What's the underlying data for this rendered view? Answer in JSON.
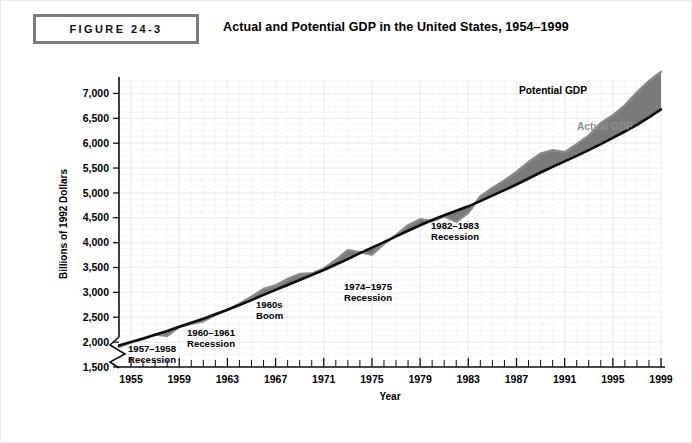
{
  "header": {
    "figure_number": "FIGURE 24-3",
    "title": "Actual and Potential GDP in the United States, 1954–1999"
  },
  "chart_data": {
    "type": "line",
    "title": "Actual and Potential GDP in the United States, 1954–1999",
    "xlabel": "Year",
    "ylabel": "Billions of 1992 Dollars",
    "xlim": [
      1954,
      1999
    ],
    "ylim": [
      1500,
      7250
    ],
    "yticks": [
      1500,
      2000,
      2500,
      3000,
      3500,
      4000,
      4500,
      5000,
      5500,
      6000,
      6500,
      7000
    ],
    "ytick_labels": [
      "1,500",
      "2,000",
      "2,500",
      "3,000",
      "3,500",
      "4,000",
      "4,500",
      "5,000",
      "5,500",
      "6,000",
      "6,500",
      "7,000"
    ],
    "xticks": [
      1955,
      1959,
      1963,
      1967,
      1971,
      1975,
      1979,
      1983,
      1987,
      1991,
      1995,
      1999
    ],
    "xtick_labels": [
      "1955",
      "1959",
      "1963",
      "1967",
      "1971",
      "1975",
      "1979",
      "1983",
      "1987",
      "1991",
      "1995",
      "1999"
    ],
    "minor_xtick_interval": 1,
    "grid": true,
    "axis_break_y": true,
    "legend_position": "inline-right",
    "x": [
      1954,
      1955,
      1956,
      1957,
      1958,
      1959,
      1960,
      1961,
      1962,
      1963,
      1964,
      1965,
      1966,
      1967,
      1968,
      1969,
      1970,
      1971,
      1972,
      1973,
      1974,
      1975,
      1976,
      1977,
      1978,
      1979,
      1980,
      1981,
      1982,
      1983,
      1984,
      1985,
      1986,
      1987,
      1988,
      1989,
      1990,
      1991,
      1992,
      1993,
      1994,
      1995,
      1996,
      1997,
      1998,
      1999
    ],
    "series": [
      {
        "name": "Potential GDP",
        "color": "#0d0d0d",
        "values": [
          1930,
          2005,
          2075,
          2150,
          2225,
          2310,
          2390,
          2470,
          2560,
          2650,
          2745,
          2845,
          2950,
          3050,
          3150,
          3250,
          3350,
          3450,
          3560,
          3670,
          3790,
          3900,
          4010,
          4125,
          4240,
          4350,
          4455,
          4550,
          4640,
          4730,
          4835,
          4945,
          5055,
          5170,
          5290,
          5410,
          5525,
          5635,
          5745,
          5860,
          5980,
          6105,
          6235,
          6370,
          6520,
          6680
        ]
      },
      {
        "name": "Actual GDP",
        "color": "#8a8a8a",
        "values": [
          1905,
          1990,
          2060,
          2150,
          2125,
          2305,
          2370,
          2420,
          2545,
          2650,
          2770,
          2910,
          3070,
          3140,
          3270,
          3370,
          3380,
          3480,
          3650,
          3850,
          3810,
          3760,
          3975,
          4150,
          4350,
          4470,
          4430,
          4530,
          4420,
          4600,
          4930,
          5100,
          5250,
          5420,
          5620,
          5790,
          5860,
          5820,
          5980,
          6150,
          6400,
          6560,
          6760,
          7020,
          7250,
          7430
        ]
      }
    ],
    "annotations": [
      {
        "id": "1957-1958-recession",
        "text_line1": "1957–1958",
        "text_line2": "Recession",
        "x_anchor": 1957.5
      },
      {
        "id": "1960-1961-recession",
        "text_line1": "1960–1961",
        "text_line2": "Recession",
        "x_anchor": 1961.0
      },
      {
        "id": "1960s-boom",
        "text_line1": "1960s",
        "text_line2": "Boom",
        "x_anchor": 1967.0
      },
      {
        "id": "1974-1975-recession",
        "text_line1": "1974–1975",
        "text_line2": "Recession",
        "x_anchor": 1975.0
      },
      {
        "id": "1982-1983-recession",
        "text_line1": "1982–1983",
        "text_line2": "Recession",
        "x_anchor": 1983.0
      }
    ],
    "series_labels": {
      "potential": "Potential GDP",
      "actual": "Actual GDP"
    }
  }
}
